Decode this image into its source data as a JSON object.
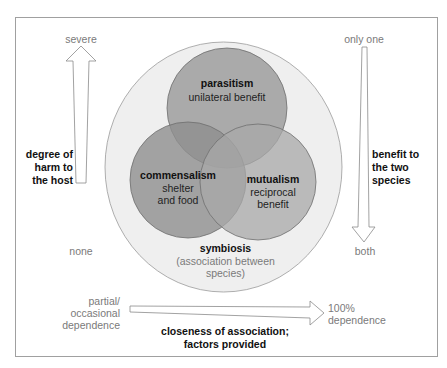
{
  "colors": {
    "frame": "#9a9a9a",
    "outer_circle_fill": "#efefef",
    "outer_circle_stroke": "#9a9a9a",
    "circle_fill": "#9c9c9c",
    "circle_stroke": "#6e6e6e",
    "arrow_stroke": "#8a8a8a",
    "muted_text": "#7a7a7a",
    "bold_text": "#111111"
  },
  "left_axis": {
    "top_label": "severe",
    "bottom_label": "none",
    "title_lines": [
      "degree of",
      "harm to",
      "the host"
    ]
  },
  "right_axis": {
    "top_label": "only one",
    "bottom_label": "both",
    "title_lines": [
      "benefit to",
      "the two",
      "species"
    ]
  },
  "bottom_axis": {
    "left_label_lines": [
      "partial/",
      "occasional",
      "dependence"
    ],
    "right_label_lines": [
      "100%",
      "dependence"
    ],
    "title_lines": [
      "closeness of association;",
      "factors provided"
    ]
  },
  "circles": {
    "parasitism": {
      "title": "parasitism",
      "subtitle": "unilateral benefit"
    },
    "commensalism": {
      "title": "commensalism",
      "subtitle_lines": [
        "shelter",
        "and food"
      ]
    },
    "mutualism": {
      "title": "mutualism",
      "subtitle_lines": [
        "reciprocal",
        "benefit"
      ]
    },
    "symbiosis": {
      "title": "symbiosis",
      "subtitle_lines": [
        "(association between",
        "species)"
      ]
    }
  }
}
